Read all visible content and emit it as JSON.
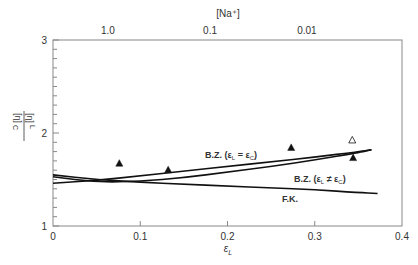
{
  "chart_data": {
    "type": "line",
    "title": "",
    "xlabel": "ε_L",
    "ylabel": "[η]_L / [η]_C",
    "top_axis_label": "[Na⁺]",
    "top_axis_ticks": [
      {
        "label": "1.0",
        "x": 0.063
      },
      {
        "label": "0.1",
        "x": 0.18
      },
      {
        "label": "0.01",
        "x": 0.291
      }
    ],
    "xlim": [
      0,
      0.4
    ],
    "ylim": [
      1,
      3
    ],
    "x_ticks": [
      "0",
      "0.1",
      "0.2",
      "0.3",
      "0.4"
    ],
    "y_ticks": [
      "1",
      "2",
      "3"
    ],
    "y_minor_step": 0.1,
    "grid": false,
    "series": [
      {
        "name": "B.Z. (ε_L = ε_C)",
        "kind": "curve",
        "x": [
          0.0,
          0.05,
          0.1,
          0.15,
          0.2,
          0.25,
          0.3,
          0.35,
          0.365
        ],
        "y": [
          1.46,
          1.49,
          1.54,
          1.59,
          1.64,
          1.69,
          1.74,
          1.8,
          1.82
        ]
      },
      {
        "name": "B.Z. (ε_L ≠ ε_C)",
        "kind": "curve",
        "x": [
          0.0,
          0.05,
          0.1,
          0.15,
          0.2,
          0.25,
          0.3,
          0.35,
          0.365
        ],
        "y": [
          1.53,
          1.47,
          1.48,
          1.52,
          1.58,
          1.64,
          1.71,
          1.79,
          1.82
        ]
      },
      {
        "name": "F.K.",
        "kind": "curve",
        "x": [
          0.0,
          0.05,
          0.1,
          0.15,
          0.2,
          0.25,
          0.3,
          0.35,
          0.372
        ],
        "y": [
          1.55,
          1.5,
          1.47,
          1.45,
          1.43,
          1.41,
          1.39,
          1.36,
          1.35
        ]
      },
      {
        "name": "measured (filled)",
        "kind": "scatter",
        "marker": "filled-triangle",
        "x": [
          0.076,
          0.132,
          0.273,
          0.344
        ],
        "y": [
          1.67,
          1.6,
          1.84,
          1.73
        ]
      },
      {
        "name": "measured (open)",
        "kind": "scatter",
        "marker": "open-triangle",
        "x": [
          0.343
        ],
        "y": [
          1.92
        ]
      }
    ],
    "annotations": [
      {
        "text": "B.Z. (ε_L = ε_C)",
        "x": 0.22,
        "y": 1.87
      },
      {
        "text": "B.Z. (ε_L ≠ ε_C)",
        "x": 0.29,
        "y": 1.48
      },
      {
        "text": "F.K.",
        "x": 0.245,
        "y": 1.25
      }
    ]
  },
  "labels": {
    "top_axis": "[Na⁺]",
    "x_axis": "ε",
    "x_axis_sub": "L",
    "y_num": "[η]",
    "y_num_sub": "L",
    "y_den": "[η]",
    "y_den_sub": "C",
    "bz_equal": "B.Z. (ε",
    "bz_equal_mid": " = ε",
    "bz_notequal_mid": " ≠ ε",
    "sub_L": "L",
    "sub_C": "C",
    "close": ")",
    "fk": "F.K."
  }
}
